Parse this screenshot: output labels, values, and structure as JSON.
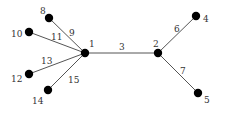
{
  "diagram": {
    "type": "tree-graph",
    "nodes": [
      {
        "id": "1",
        "label": "1",
        "x": 85,
        "y": 53,
        "lx": 89,
        "ly": 47
      },
      {
        "id": "2",
        "label": "2",
        "x": 158,
        "y": 53,
        "lx": 153,
        "ly": 47
      },
      {
        "id": "4",
        "label": "4",
        "x": 196,
        "y": 16,
        "lx": 203,
        "ly": 22
      },
      {
        "id": "5",
        "label": "5",
        "x": 198,
        "y": 93,
        "lx": 204,
        "ly": 103
      },
      {
        "id": "8",
        "label": "8",
        "x": 49,
        "y": 18,
        "lx": 40,
        "ly": 14
      },
      {
        "id": "10",
        "label": "10",
        "x": 29,
        "y": 32,
        "lx": 11,
        "ly": 37
      },
      {
        "id": "12",
        "label": "12",
        "x": 29,
        "y": 74,
        "lx": 11,
        "ly": 82
      },
      {
        "id": "14",
        "label": "14",
        "x": 48,
        "y": 90,
        "lx": 32,
        "ly": 104
      }
    ],
    "edges": [
      {
        "from": "1",
        "to": "2",
        "label": "3",
        "lx": 119,
        "ly": 50
      },
      {
        "from": "2",
        "to": "4",
        "label": "6",
        "lx": 174,
        "ly": 32
      },
      {
        "from": "2",
        "to": "5",
        "label": "7",
        "lx": 180,
        "ly": 74
      },
      {
        "from": "1",
        "to": "8",
        "label": "9",
        "lx": 69,
        "ly": 36
      },
      {
        "from": "1",
        "to": "10",
        "label": "11",
        "lx": 51,
        "ly": 40
      },
      {
        "from": "1",
        "to": "12",
        "label": "13",
        "lx": 41,
        "ly": 64
      },
      {
        "from": "1",
        "to": "14",
        "label": "15",
        "lx": 68,
        "ly": 83
      }
    ]
  }
}
